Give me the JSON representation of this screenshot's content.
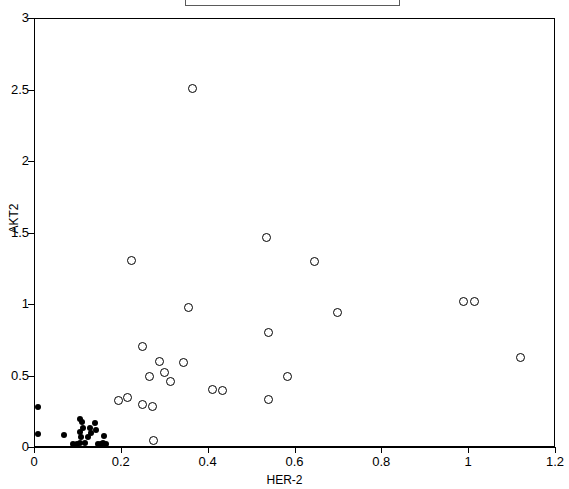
{
  "figure": {
    "legend": {
      "visible": true,
      "clipped_at_top": true,
      "entries": [
        {
          "marker": "open-circle",
          "label": ""
        }
      ]
    },
    "axis_title_x": "HER-2",
    "axis_title_y": "AKT2"
  },
  "chart_data": {
    "type": "scatter",
    "title": "",
    "xlabel": "HER-2",
    "ylabel": "AKT2",
    "xlim": [
      0,
      1.2
    ],
    "ylim": [
      0,
      3
    ],
    "xticks": [
      0,
      0.2,
      0.4,
      0.6,
      0.8,
      1,
      1.2
    ],
    "xticklabels": [
      "0",
      "0.2",
      "0.4",
      "0.6",
      "0.8",
      "1",
      "1.2"
    ],
    "yticks": [
      0,
      0.5,
      1,
      1.5,
      2,
      2.5,
      3
    ],
    "yticklabels": [
      "0",
      "0.5",
      "1",
      "1.5",
      "2",
      "2.5",
      "3"
    ],
    "grid": false,
    "frame": true,
    "legend_position": "top-center",
    "series": [
      {
        "name": "open-circles",
        "marker": "open-circle",
        "color": "#000000",
        "points": [
          [
            0.365,
            2.505
          ],
          [
            0.225,
            1.305
          ],
          [
            0.535,
            1.465
          ],
          [
            0.645,
            1.3
          ],
          [
            0.355,
            0.975
          ],
          [
            0.7,
            0.94
          ],
          [
            0.99,
            1.02
          ],
          [
            1.015,
            1.02
          ],
          [
            0.25,
            0.7
          ],
          [
            0.54,
            0.8
          ],
          [
            1.12,
            0.625
          ],
          [
            0.29,
            0.6
          ],
          [
            0.345,
            0.59
          ],
          [
            0.265,
            0.49
          ],
          [
            0.3,
            0.52
          ],
          [
            0.315,
            0.455
          ],
          [
            0.41,
            0.4
          ],
          [
            0.435,
            0.395
          ],
          [
            0.585,
            0.495
          ],
          [
            0.54,
            0.335
          ],
          [
            0.195,
            0.325
          ],
          [
            0.215,
            0.345
          ],
          [
            0.25,
            0.295
          ],
          [
            0.272,
            0.28
          ],
          [
            0.275,
            0.045
          ]
        ]
      },
      {
        "name": "filled-dots",
        "marker": "filled-circle",
        "color": "#000000",
        "points": [
          [
            0.01,
            0.28
          ],
          [
            0.01,
            0.09
          ],
          [
            0.07,
            0.085
          ],
          [
            0.105,
            0.195
          ],
          [
            0.11,
            0.175
          ],
          [
            0.112,
            0.13
          ],
          [
            0.105,
            0.105
          ],
          [
            0.108,
            0.07
          ],
          [
            0.106,
            0.03
          ],
          [
            0.118,
            0.03
          ],
          [
            0.125,
            0.07
          ],
          [
            0.128,
            0.135
          ],
          [
            0.132,
            0.1
          ],
          [
            0.14,
            0.17
          ],
          [
            0.142,
            0.12
          ],
          [
            0.148,
            0.02
          ],
          [
            0.155,
            0.022
          ],
          [
            0.16,
            0.03
          ],
          [
            0.162,
            0.075
          ],
          [
            0.165,
            0.022
          ],
          [
            0.09,
            0.02
          ],
          [
            0.098,
            0.018
          ]
        ]
      }
    ]
  }
}
